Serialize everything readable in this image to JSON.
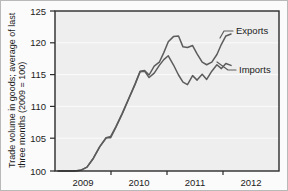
{
  "chart_data": {
    "type": "line",
    "title": "",
    "xlabel": "",
    "ylabel": "Trade volume in goods; average of last three months (2009 = 100)",
    "xlim": [
      2008.75,
      2012.25
    ],
    "ylim": [
      100,
      125
    ],
    "ytick_labels": [
      "100",
      "105",
      "110",
      "115",
      "120",
      "125"
    ],
    "ytick_values": [
      100,
      105,
      110,
      115,
      120,
      125
    ],
    "xtick_labels": [
      "2009",
      "2010",
      "2011",
      "2012"
    ],
    "xtick_values": [
      2009,
      2010,
      2011,
      2012
    ],
    "grid": true,
    "legend_position": "inline-right",
    "line_color": "#5c5c5c",
    "plot_background": "#eeeeee",
    "figure_background": "#fbfbfb",
    "series": [
      {
        "name": "Exports",
        "label": "Exports",
        "x": [
          2008.8,
          2008.95,
          2009.05,
          2009.15,
          2009.25,
          2009.35,
          2009.45,
          2009.55,
          2009.62,
          2009.7,
          2009.8,
          2009.9,
          2010.0,
          2010.08,
          2010.15,
          2010.22,
          2010.3,
          2010.38,
          2010.45,
          2010.52,
          2010.6,
          2010.68,
          2010.75,
          2010.82,
          2010.9,
          2010.97,
          2011.05,
          2011.12,
          2011.2,
          2011.28,
          2011.35,
          2011.42,
          2011.5
        ],
        "values": [
          100.0,
          100.0,
          100.0,
          100.1,
          100.6,
          102.0,
          103.8,
          105.2,
          105.4,
          106.9,
          109.0,
          111.3,
          113.6,
          115.6,
          115.7,
          115.0,
          116.4,
          117.0,
          118.5,
          120.2,
          121.0,
          121.1,
          119.4,
          119.3,
          119.6,
          118.3,
          117.0,
          116.6,
          117.0,
          118.2,
          119.8,
          121.1,
          121.4
        ]
      },
      {
        "name": "Imports",
        "label": "Imports",
        "x": [
          2008.8,
          2008.95,
          2009.05,
          2009.15,
          2009.25,
          2009.35,
          2009.45,
          2009.55,
          2009.62,
          2009.7,
          2009.8,
          2009.9,
          2010.0,
          2010.08,
          2010.15,
          2010.22,
          2010.3,
          2010.38,
          2010.45,
          2010.52,
          2010.6,
          2010.68,
          2010.75,
          2010.82,
          2010.9,
          2010.97,
          2011.05,
          2011.12,
          2011.2,
          2011.28,
          2011.35,
          2011.42,
          2011.5
        ],
        "values": [
          100.0,
          100.0,
          100.0,
          100.1,
          100.6,
          102.0,
          103.8,
          105.2,
          105.2,
          106.8,
          108.9,
          111.2,
          113.5,
          115.5,
          115.6,
          114.6,
          115.3,
          116.5,
          117.4,
          118.0,
          116.6,
          115.0,
          113.9,
          113.5,
          114.9,
          114.2,
          115.1,
          114.3,
          115.6,
          116.6,
          116.0,
          116.8,
          116.5
        ]
      }
    ]
  }
}
